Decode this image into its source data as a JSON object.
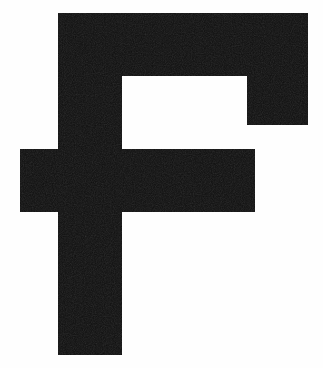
{
  "image": {
    "kind": "glyph-render",
    "character": "F",
    "description": "Large bold sans-serif capital letter F rendered in black on a white background",
    "width": 323,
    "height": 368,
    "background_color": "#fefefe",
    "ink_color": "#0d0d0d"
  },
  "glyph": {
    "name": "letter-f",
    "label": "F",
    "case": "uppercase",
    "weight": "bold",
    "style": "sans-serif",
    "fill_color": "#0d0d0d",
    "bounding_box": {
      "x": 20,
      "y": 13,
      "width": 288,
      "height": 342
    },
    "outline_path": "M 58 13 L 308 13 L 308 125 L 247 125 L 247 76 L 122 76 L 122 149 L 255 149 L 255 212 L 122 212 L 122 355 L 58 355 L 58 212 L 20 212 L 20 149 L 58 149 Z",
    "parts": [
      {
        "name": "top-arm",
        "x": 58,
        "y": 13,
        "width": 250,
        "height": 63
      },
      {
        "name": "top-arm-right-drop",
        "x": 247,
        "y": 76,
        "width": 61,
        "height": 49
      },
      {
        "name": "stem-upper",
        "x": 58,
        "y": 76,
        "width": 64,
        "height": 73
      },
      {
        "name": "middle-crossbar",
        "x": 20,
        "y": 149,
        "width": 235,
        "height": 63
      },
      {
        "name": "stem-lower",
        "x": 58,
        "y": 212,
        "width": 64,
        "height": 143
      }
    ],
    "counters": [
      {
        "name": "upper-right-counter",
        "x": 122,
        "y": 76,
        "width": 125,
        "height": 73
      }
    ]
  }
}
